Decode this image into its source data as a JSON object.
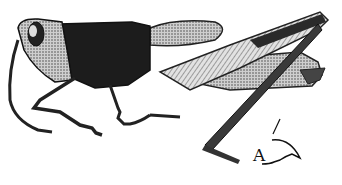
{
  "figure": {
    "label": "A",
    "colors": {
      "ink": "#1a1a1a",
      "mid": "#555555",
      "light": "#bdbdbd",
      "paper": "#ffffff"
    }
  }
}
